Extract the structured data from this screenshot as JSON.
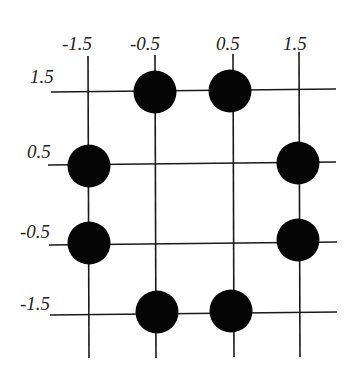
{
  "diagram": {
    "title": "",
    "x_labels": [
      {
        "text": "-1.5",
        "x": 88
      },
      {
        "text": "-0.5",
        "x": 155
      },
      {
        "text": "0.5",
        "x": 233
      },
      {
        "text": "1.5",
        "x": 299
      }
    ],
    "y_labels": [
      {
        "text": "1.5",
        "y": 91
      },
      {
        "text": "0.5",
        "y": 166
      },
      {
        "text": "-0.5",
        "y": 243
      },
      {
        "text": "-1.5",
        "y": 315
      }
    ],
    "dots": [
      {
        "x": -0.5,
        "y": 1.5
      },
      {
        "x": 0.5,
        "y": 1.5
      },
      {
        "x": -1.5,
        "y": 0.5
      },
      {
        "x": 1.5,
        "y": 0.5
      },
      {
        "x": -1.5,
        "y": -0.5
      },
      {
        "x": 1.5,
        "y": -0.5
      },
      {
        "x": -0.5,
        "y": -1.5
      },
      {
        "x": 0.5,
        "y": -1.5
      }
    ],
    "colors": {
      "line": "#1a1a1a",
      "dot": "#050505",
      "background": "#ffffff"
    }
  }
}
